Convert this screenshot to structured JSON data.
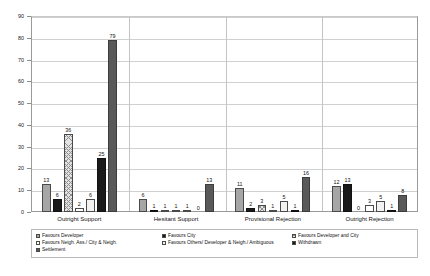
{
  "chart_data": {
    "type": "bar",
    "title": "",
    "xlabel": "",
    "ylabel": "",
    "ylim": [
      0,
      90
    ],
    "ytick_step": 10,
    "yticks": [
      "0",
      "10",
      "20",
      "30",
      "40",
      "50",
      "60",
      "70",
      "80",
      "90"
    ],
    "grid": true,
    "legend_position": "bottom",
    "categories": [
      "Outright Support",
      "Hesitant Support",
      "Provisional Rejection",
      "Outright Rejection"
    ],
    "series": [
      {
        "name": "Favours Developer",
        "values": [
          13,
          6,
          11,
          12
        ]
      },
      {
        "name": "Favours City",
        "values": [
          6,
          1,
          2,
          13
        ]
      },
      {
        "name": "Favours Developer and City",
        "values": [
          36,
          1,
          3,
          0
        ]
      },
      {
        "name": "Favours Neigh. Ass./ City & Neigh.",
        "values": [
          2,
          1,
          1,
          3
        ]
      },
      {
        "name": "Favours Others/ Developer & Neigh./ Ambiguous",
        "values": [
          6,
          1,
          5,
          5
        ]
      },
      {
        "name": "Withdrawn",
        "values": [
          25,
          0,
          1,
          1
        ]
      },
      {
        "name": "Settlement",
        "values": [
          79,
          13,
          16,
          8
        ]
      }
    ]
  }
}
